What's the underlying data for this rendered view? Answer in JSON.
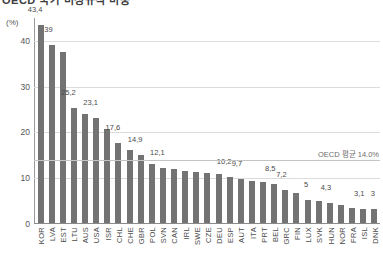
{
  "title_partial": "OECD 국가 비정규직 비중",
  "axis": {
    "unit_label": "(%)",
    "yticks": [
      0,
      10,
      20,
      30,
      40
    ],
    "ylabel": "(%)"
  },
  "average": {
    "label": "OECD 평균 14.0%",
    "value": 14.0
  },
  "chart_data": {
    "type": "bar",
    "title": "OECD 국가 비정규직 비중",
    "xlabel": "",
    "ylabel": "(%)",
    "ylim": [
      0,
      45
    ],
    "grid": true,
    "legend": null,
    "series_color": "#737373",
    "annotations": [
      {
        "type": "hline",
        "value": 14.0,
        "label": "OECD 평균 14.0%"
      }
    ],
    "categories": [
      "KOR",
      "LVA",
      "EST",
      "LTU",
      "AUS",
      "USA",
      "ISR",
      "CHL",
      "CHE",
      "GBR",
      "POL",
      "SVN",
      "CAN",
      "IRL",
      "SWE",
      "CZE",
      "DEU",
      "ESP",
      "AUT",
      "ITA",
      "PRT",
      "BEL",
      "GRC",
      "FIN",
      "LUX",
      "SVK",
      "HUN",
      "NOR",
      "FRA",
      "ISL",
      "DNK"
    ],
    "values": [
      43.4,
      39,
      37.5,
      25.2,
      24.0,
      23.1,
      20.6,
      17.6,
      16.0,
      14.9,
      13.0,
      12.1,
      11.9,
      11.5,
      11.3,
      11.0,
      10.8,
      10.2,
      9.7,
      9.3,
      9.0,
      8.5,
      7.2,
      6.5,
      5,
      4.8,
      4.3,
      4.0,
      3.4,
      3.1,
      3
    ],
    "data_labels": [
      "43,4",
      "39",
      "",
      "25,2",
      "",
      "23,1",
      "",
      "17,6",
      "",
      "14,9",
      "",
      "12,1",
      "",
      "",
      "",
      "",
      "",
      "10,2",
      "9,7",
      "",
      "",
      "8,5",
      "7,2",
      "",
      "5",
      "",
      "4,3",
      "",
      "",
      "3,1",
      "3"
    ]
  }
}
